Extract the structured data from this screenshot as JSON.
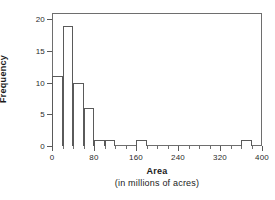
{
  "chart_data": {
    "type": "bar",
    "title": "",
    "xlabel": "Area",
    "xlabel_sub": "(in millions of acres)",
    "ylabel": "Frequency",
    "xlim": [
      0,
      400
    ],
    "ylim": [
      0,
      21
    ],
    "grid": false,
    "legend": "none",
    "bin_width": 20,
    "x_major_ticks": [
      0,
      80,
      160,
      240,
      320,
      400
    ],
    "x_major_tick_labels": [
      "0",
      "80",
      "160",
      "240",
      "320",
      "400"
    ],
    "x_minor_tick_step": 20,
    "y_ticks": [
      0,
      5,
      10,
      15,
      20
    ],
    "y_tick_labels": [
      "0",
      "5",
      "10",
      "15",
      "20"
    ],
    "bins": [
      {
        "start": 0,
        "end": 20,
        "frequency": 11
      },
      {
        "start": 20,
        "end": 40,
        "frequency": 19
      },
      {
        "start": 40,
        "end": 60,
        "frequency": 10
      },
      {
        "start": 60,
        "end": 80,
        "frequency": 6
      },
      {
        "start": 80,
        "end": 100,
        "frequency": 1
      },
      {
        "start": 100,
        "end": 120,
        "frequency": 1
      },
      {
        "start": 160,
        "end": 180,
        "frequency": 1
      },
      {
        "start": 360,
        "end": 380,
        "frequency": 1
      }
    ],
    "categories": [
      "0-20",
      "20-40",
      "40-60",
      "60-80",
      "80-100",
      "100-120",
      "160-180",
      "360-380"
    ],
    "values": [
      11,
      19,
      10,
      6,
      1,
      1,
      1,
      1
    ],
    "colors": {
      "bar_stroke": "#5a5a5a",
      "bar_fill": "#ffffff",
      "axis": "#5a5a5a",
      "frame": "#6e6e6e",
      "text": "#1a1a1a",
      "background": "#ffffff"
    }
  }
}
